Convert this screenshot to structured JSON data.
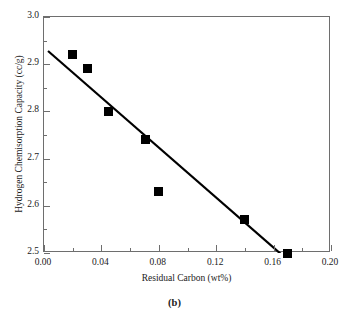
{
  "figure": {
    "caption": "(b)"
  },
  "chart_data": {
    "type": "scatter",
    "title": "",
    "xlabel": "Residual Carbon (wt%)",
    "ylabel": "Hydrogen Chemisorption Capacity (cc/g)",
    "xlim": [
      0.0,
      0.2
    ],
    "ylim": [
      2.5,
      3.0
    ],
    "xticks": [
      0.0,
      0.04,
      0.08,
      0.12,
      0.16,
      0.2
    ],
    "xticklabels": [
      "0.00",
      "0.04",
      "0.08",
      "0.12",
      "0.16",
      "0.20"
    ],
    "xminorticks": [
      0.02,
      0.06,
      0.1,
      0.14,
      0.18
    ],
    "yticks": [
      2.5,
      2.6,
      2.7,
      2.8,
      2.9,
      3.0
    ],
    "yticklabels": [
      "2.5",
      "2.6",
      "2.7",
      "2.8",
      "2.9",
      "3.0"
    ],
    "yminorticks": [
      2.55,
      2.65,
      2.75,
      2.85,
      2.95
    ],
    "grid": false,
    "legend": null,
    "marker": "filled-square",
    "marker_color": "#000000",
    "points": [
      {
        "x": 0.02,
        "y": 2.92
      },
      {
        "x": 0.03,
        "y": 2.89
      },
      {
        "x": 0.045,
        "y": 2.8
      },
      {
        "x": 0.071,
        "y": 2.74
      },
      {
        "x": 0.08,
        "y": 2.63
      },
      {
        "x": 0.14,
        "y": 2.57
      },
      {
        "x": 0.17,
        "y": 2.5
      }
    ],
    "trendline": {
      "type": "linear-fit",
      "color": "#000000",
      "x_start": 0.0028,
      "y_start": 2.928,
      "x_end": 0.1805,
      "y_end": 2.457
    }
  }
}
